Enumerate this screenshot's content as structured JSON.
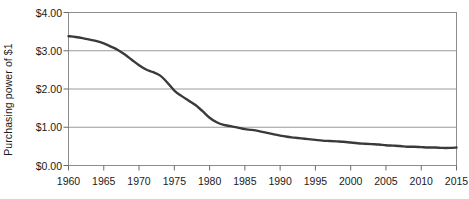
{
  "chart_data": {
    "type": "line",
    "title": "",
    "xlabel": "",
    "ylabel": "Purchasing power of $1",
    "xlim": [
      1960,
      2015
    ],
    "ylim": [
      0,
      4
    ],
    "grid": "horizontal",
    "legend": "none",
    "line_color": "#3a3a3a",
    "gridline_color": "#9a9a9a",
    "border_color": "#8c8c8c",
    "plot_background": "#ffffff",
    "x_ticks": [
      1960,
      1965,
      1970,
      1975,
      1980,
      1985,
      1990,
      1995,
      2000,
      2005,
      2010,
      2015
    ],
    "x_tick_labels": [
      "1960",
      "1965",
      "1970",
      "1975",
      "1980",
      "1985",
      "1990",
      "1995",
      "2000",
      "2005",
      "2010",
      "2015"
    ],
    "y_ticks": [
      0,
      1,
      2,
      3,
      4
    ],
    "y_tick_labels": [
      "$0.00",
      "$1.00",
      "$2.00",
      "$3.00",
      "$4.00"
    ],
    "series": [
      {
        "name": "Purchasing power of $1",
        "x": [
          1960,
          1961,
          1962,
          1963,
          1964,
          1965,
          1966,
          1967,
          1968,
          1969,
          1970,
          1971,
          1972,
          1973,
          1974,
          1975,
          1976,
          1977,
          1978,
          1979,
          1980,
          1981,
          1982,
          1983,
          1984,
          1985,
          1986,
          1987,
          1988,
          1989,
          1990,
          1991,
          1992,
          1993,
          1994,
          1995,
          1996,
          1997,
          1998,
          1999,
          2000,
          2001,
          2002,
          2003,
          2004,
          2005,
          2006,
          2007,
          2008,
          2009,
          2010,
          2011,
          2012,
          2013,
          2014,
          2015
        ],
        "values": [
          3.38,
          3.36,
          3.33,
          3.29,
          3.25,
          3.19,
          3.11,
          3.02,
          2.9,
          2.76,
          2.62,
          2.51,
          2.44,
          2.35,
          2.17,
          1.96,
          1.82,
          1.7,
          1.58,
          1.42,
          1.25,
          1.13,
          1.06,
          1.03,
          0.99,
          0.95,
          0.93,
          0.9,
          0.86,
          0.82,
          0.78,
          0.75,
          0.73,
          0.71,
          0.69,
          0.67,
          0.65,
          0.64,
          0.63,
          0.62,
          0.6,
          0.58,
          0.57,
          0.56,
          0.55,
          0.53,
          0.52,
          0.51,
          0.49,
          0.49,
          0.48,
          0.47,
          0.47,
          0.46,
          0.46,
          0.47
        ]
      }
    ]
  }
}
